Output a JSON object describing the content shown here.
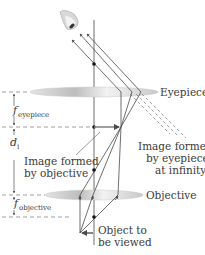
{
  "labels": {
    "eyepiece": "Eyepiece",
    "objective": "Objective",
    "image_by_objective_line1": "Image formed",
    "image_by_objective_line2": "by objective",
    "image_by_eyepiece_line1": "Image formed",
    "image_by_eyepiece_line2": "by eyepiece",
    "image_by_eyepiece_line3": "at infinity",
    "object_line1": "Object to",
    "object_line2": "be viewed"
  },
  "dimensions": {
    "f_eyepiece_symbol": "f",
    "f_eyepiece_subscript": "eyepiece",
    "d_i_symbol": "d",
    "d_i_subscript": "i",
    "f_objective_symbol": "f",
    "f_objective_subscript": "objective"
  },
  "colors": {
    "ray": "#4a4a4a",
    "lens": "#cfcfcf",
    "dashed": "#777777",
    "text": "#3a3a3a",
    "image_arrow": "#8a8a8a"
  }
}
